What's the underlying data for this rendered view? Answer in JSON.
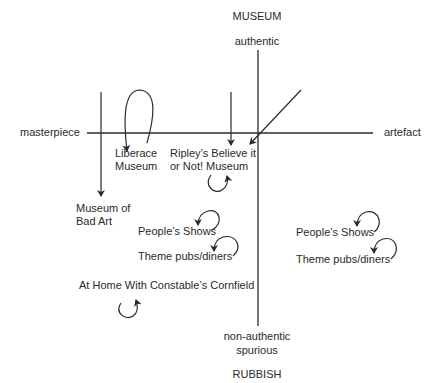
{
  "diagram": {
    "axes": {
      "top": "MUSEUM",
      "top_sub": "authentic",
      "bottom_sub1": "non-authentic",
      "bottom_sub2": "spurious",
      "bottom": "RUBBISH",
      "left": "masterpiece",
      "right": "artefact"
    },
    "items": {
      "liberace_1": "Liberace",
      "liberace_2": "Museum",
      "ripley_1": "Ripley’s Believe it",
      "ripley_2": "or Not! Museum",
      "bad_art_1": "Museum of",
      "bad_art_2": "Bad Art",
      "peoples_shows_left": "People’s Shows",
      "theme_pubs_left": "Theme pubs/diners",
      "constable": "At Home With Constable’s Cornfield",
      "peoples_shows_right": "People’s Shows",
      "theme_pubs_right": "Theme pubs/diners"
    },
    "colors": {
      "line": "#2a2a2a",
      "background": "#ffffff"
    }
  }
}
